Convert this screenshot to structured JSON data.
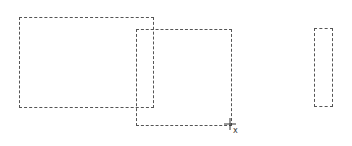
{
  "canvas": {
    "background": "#ffffff",
    "stroke_color": "#555555",
    "selection_rects": [
      {
        "left": 19,
        "top": 17,
        "width": 135,
        "height": 91
      },
      {
        "left": 136,
        "top": 29,
        "width": 96,
        "height": 97
      },
      {
        "left": 314,
        "top": 28,
        "width": 19,
        "height": 79
      }
    ],
    "cursor": {
      "type": "crosshair-icon",
      "x": 230,
      "y": 124,
      "glyph": "x"
    }
  }
}
